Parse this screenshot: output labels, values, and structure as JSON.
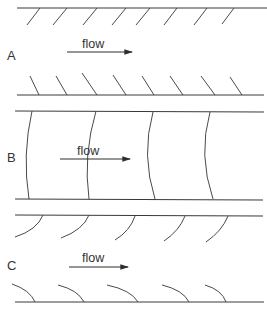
{
  "diagram": {
    "panels": [
      {
        "id": "A",
        "label": "A",
        "flow_label": "flow",
        "description": "Straight inclined hatches on both walls"
      },
      {
        "id": "B",
        "label": "B",
        "flow_label": "flow",
        "description": "Curved transverse fronts spanning the channel"
      },
      {
        "id": "C",
        "label": "C",
        "flow_label": "flow",
        "description": "Curved hooks on both walls"
      }
    ],
    "colors": {
      "line": "#3a3a3a",
      "text": "#333333",
      "background": "#ffffff"
    }
  }
}
